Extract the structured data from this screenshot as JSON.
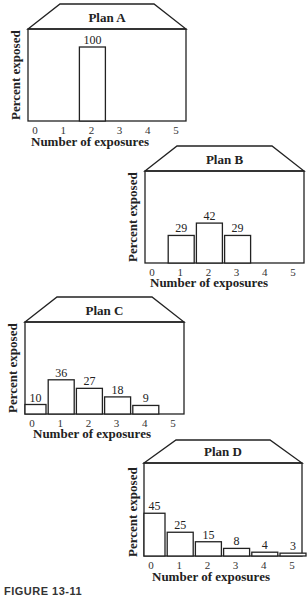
{
  "chart_data": [
    {
      "type": "bar",
      "title": "Plan A",
      "xlabel": "Number of exposures",
      "ylabel": "Percent exposed",
      "categories": [
        "0",
        "1",
        "2",
        "3",
        "4",
        "5"
      ],
      "values": [
        0,
        0,
        100,
        0,
        0,
        0
      ],
      "data_labels": [
        "",
        "",
        "100",
        "",
        "",
        ""
      ],
      "grid": false,
      "legend": null
    },
    {
      "type": "bar",
      "title": "Plan B",
      "xlabel": "Number of exposures",
      "ylabel": "Percent exposed",
      "categories": [
        "0",
        "1",
        "2",
        "3",
        "4",
        "5"
      ],
      "values": [
        0,
        29,
        42,
        29,
        0,
        0
      ],
      "data_labels": [
        "",
        "29",
        "42",
        "29",
        "",
        ""
      ],
      "grid": false,
      "legend": null
    },
    {
      "type": "bar",
      "title": "Plan C",
      "xlabel": "Number of exposures",
      "ylabel": "Percent exposed",
      "categories": [
        "0",
        "1",
        "2",
        "3",
        "4",
        "5"
      ],
      "values": [
        10,
        36,
        27,
        18,
        9,
        0
      ],
      "data_labels": [
        "10",
        "36",
        "27",
        "18",
        "9",
        ""
      ],
      "grid": false,
      "legend": null
    },
    {
      "type": "bar",
      "title": "Plan D",
      "xlabel": "Number of exposures",
      "ylabel": "Percent exposed",
      "categories": [
        "0",
        "1",
        "2",
        "3",
        "4",
        "5"
      ],
      "values": [
        45,
        25,
        15,
        8,
        4,
        3
      ],
      "data_labels": [
        "45",
        "25",
        "15",
        "8",
        "4",
        "3"
      ],
      "grid": false,
      "legend": null
    }
  ],
  "charts": [
    {
      "title": "Plan A",
      "ylabel": "Percent exposed",
      "xlabel": "Number of exposures"
    },
    {
      "title": "Plan B",
      "ylabel": "Percent exposed",
      "xlabel": "Number of exposures"
    },
    {
      "title": "Plan C",
      "ylabel": "Percent exposed",
      "xlabel": "Number of exposures"
    },
    {
      "title": "Plan D",
      "ylabel": "Percent exposed",
      "xlabel": "Number of exposures"
    }
  ],
  "caption": "FIGURE 13-11",
  "colors": {
    "line": "#222222",
    "bar_fill": "#ffffff",
    "background": "#ffffff"
  }
}
